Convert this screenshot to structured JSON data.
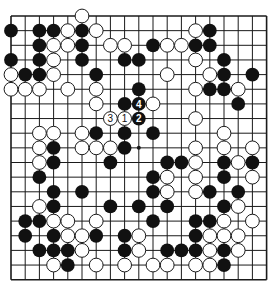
{
  "diagram": {
    "type": "go-board",
    "size": 19,
    "colors": {
      "black": "#111111",
      "white": "#ffffff",
      "line": "#1a1a1a",
      "background": "#ffffff"
    },
    "hoshi": [
      [
        3,
        3
      ],
      [
        3,
        9
      ],
      [
        3,
        15
      ],
      [
        9,
        3
      ],
      [
        9,
        9
      ],
      [
        9,
        15
      ],
      [
        15,
        3
      ],
      [
        15,
        9
      ],
      [
        15,
        15
      ]
    ],
    "stones": [
      {
        "r": 0,
        "c": 5,
        "color": "W"
      },
      {
        "r": 1,
        "c": 0,
        "color": "B"
      },
      {
        "r": 1,
        "c": 2,
        "color": "B"
      },
      {
        "r": 1,
        "c": 3,
        "color": "B"
      },
      {
        "r": 1,
        "c": 4,
        "color": "W"
      },
      {
        "r": 1,
        "c": 5,
        "color": "B"
      },
      {
        "r": 1,
        "c": 6,
        "color": "W"
      },
      {
        "r": 1,
        "c": 13,
        "color": "W"
      },
      {
        "r": 1,
        "c": 14,
        "color": "B"
      },
      {
        "r": 2,
        "c": 2,
        "color": "B"
      },
      {
        "r": 2,
        "c": 3,
        "color": "W"
      },
      {
        "r": 2,
        "c": 4,
        "color": "W"
      },
      {
        "r": 2,
        "c": 5,
        "color": "B"
      },
      {
        "r": 2,
        "c": 7,
        "color": "W"
      },
      {
        "r": 2,
        "c": 8,
        "color": "W"
      },
      {
        "r": 2,
        "c": 10,
        "color": "B"
      },
      {
        "r": 2,
        "c": 11,
        "color": "W"
      },
      {
        "r": 2,
        "c": 12,
        "color": "W"
      },
      {
        "r": 2,
        "c": 13,
        "color": "B"
      },
      {
        "r": 2,
        "c": 14,
        "color": "B"
      },
      {
        "r": 3,
        "c": 0,
        "color": "B"
      },
      {
        "r": 3,
        "c": 2,
        "color": "B"
      },
      {
        "r": 3,
        "c": 3,
        "color": "W"
      },
      {
        "r": 3,
        "c": 5,
        "color": "B"
      },
      {
        "r": 3,
        "c": 8,
        "color": "B"
      },
      {
        "r": 3,
        "c": 9,
        "color": "B"
      },
      {
        "r": 3,
        "c": 13,
        "color": "W"
      },
      {
        "r": 3,
        "c": 15,
        "color": "B"
      },
      {
        "r": 4,
        "c": 0,
        "color": "W"
      },
      {
        "r": 4,
        "c": 1,
        "color": "B"
      },
      {
        "r": 4,
        "c": 2,
        "color": "B"
      },
      {
        "r": 4,
        "c": 3,
        "color": "W"
      },
      {
        "r": 4,
        "c": 6,
        "color": "B"
      },
      {
        "r": 4,
        "c": 11,
        "color": "W"
      },
      {
        "r": 4,
        "c": 14,
        "color": "W"
      },
      {
        "r": 4,
        "c": 15,
        "color": "B"
      },
      {
        "r": 4,
        "c": 17,
        "color": "B"
      },
      {
        "r": 5,
        "c": 0,
        "color": "W"
      },
      {
        "r": 5,
        "c": 1,
        "color": "W"
      },
      {
        "r": 5,
        "c": 2,
        "color": "W"
      },
      {
        "r": 5,
        "c": 4,
        "color": "W"
      },
      {
        "r": 5,
        "c": 6,
        "color": "W"
      },
      {
        "r": 5,
        "c": 9,
        "color": "B"
      },
      {
        "r": 5,
        "c": 13,
        "color": "W"
      },
      {
        "r": 5,
        "c": 14,
        "color": "B"
      },
      {
        "r": 5,
        "c": 15,
        "color": "B"
      },
      {
        "r": 5,
        "c": 16,
        "color": "W"
      },
      {
        "r": 6,
        "c": 6,
        "color": "W"
      },
      {
        "r": 6,
        "c": 8,
        "color": "B"
      },
      {
        "r": 6,
        "c": 9,
        "color": "B",
        "label": "4"
      },
      {
        "r": 6,
        "c": 10,
        "color": "W"
      },
      {
        "r": 6,
        "c": 16,
        "color": "B"
      },
      {
        "r": 7,
        "c": 7,
        "color": "W",
        "label": "3"
      },
      {
        "r": 7,
        "c": 8,
        "color": "W",
        "label": "1"
      },
      {
        "r": 7,
        "c": 9,
        "color": "B",
        "label": "2"
      },
      {
        "r": 7,
        "c": 13,
        "color": "W"
      },
      {
        "r": 8,
        "c": 2,
        "color": "W"
      },
      {
        "r": 8,
        "c": 3,
        "color": "W"
      },
      {
        "r": 8,
        "c": 5,
        "color": "W"
      },
      {
        "r": 8,
        "c": 6,
        "color": "B"
      },
      {
        "r": 8,
        "c": 8,
        "color": "B"
      },
      {
        "r": 8,
        "c": 10,
        "color": "B"
      },
      {
        "r": 8,
        "c": 15,
        "color": "W"
      },
      {
        "r": 9,
        "c": 2,
        "color": "W"
      },
      {
        "r": 9,
        "c": 3,
        "color": "B"
      },
      {
        "r": 9,
        "c": 5,
        "color": "W"
      },
      {
        "r": 9,
        "c": 6,
        "color": "W"
      },
      {
        "r": 9,
        "c": 7,
        "color": "W"
      },
      {
        "r": 9,
        "c": 8,
        "color": "B"
      },
      {
        "r": 9,
        "c": 13,
        "color": "W"
      },
      {
        "r": 9,
        "c": 15,
        "color": "W"
      },
      {
        "r": 9,
        "c": 17,
        "color": "W"
      },
      {
        "r": 10,
        "c": 2,
        "color": "W"
      },
      {
        "r": 10,
        "c": 3,
        "color": "B"
      },
      {
        "r": 10,
        "c": 7,
        "color": "B"
      },
      {
        "r": 10,
        "c": 11,
        "color": "B"
      },
      {
        "r": 10,
        "c": 12,
        "color": "B"
      },
      {
        "r": 10,
        "c": 13,
        "color": "W"
      },
      {
        "r": 10,
        "c": 15,
        "color": "B"
      },
      {
        "r": 10,
        "c": 16,
        "color": "W"
      },
      {
        "r": 10,
        "c": 17,
        "color": "B"
      },
      {
        "r": 11,
        "c": 2,
        "color": "B"
      },
      {
        "r": 11,
        "c": 10,
        "color": "B"
      },
      {
        "r": 11,
        "c": 11,
        "color": "W"
      },
      {
        "r": 11,
        "c": 13,
        "color": "W"
      },
      {
        "r": 11,
        "c": 15,
        "color": "B"
      },
      {
        "r": 11,
        "c": 17,
        "color": "W"
      },
      {
        "r": 12,
        "c": 3,
        "color": "B"
      },
      {
        "r": 12,
        "c": 5,
        "color": "B"
      },
      {
        "r": 12,
        "c": 10,
        "color": "B"
      },
      {
        "r": 12,
        "c": 11,
        "color": "W"
      },
      {
        "r": 12,
        "c": 13,
        "color": "W"
      },
      {
        "r": 12,
        "c": 14,
        "color": "B"
      },
      {
        "r": 12,
        "c": 16,
        "color": "B"
      },
      {
        "r": 13,
        "c": 2,
        "color": "W"
      },
      {
        "r": 13,
        "c": 3,
        "color": "B"
      },
      {
        "r": 13,
        "c": 7,
        "color": "B"
      },
      {
        "r": 13,
        "c": 9,
        "color": "B"
      },
      {
        "r": 13,
        "c": 11,
        "color": "B"
      },
      {
        "r": 13,
        "c": 15,
        "color": "B"
      },
      {
        "r": 13,
        "c": 16,
        "color": "W"
      },
      {
        "r": 14,
        "c": 1,
        "color": "B"
      },
      {
        "r": 14,
        "c": 2,
        "color": "B"
      },
      {
        "r": 14,
        "c": 3,
        "color": "W"
      },
      {
        "r": 14,
        "c": 4,
        "color": "W"
      },
      {
        "r": 14,
        "c": 6,
        "color": "W"
      },
      {
        "r": 14,
        "c": 10,
        "color": "B"
      },
      {
        "r": 14,
        "c": 13,
        "color": "B"
      },
      {
        "r": 14,
        "c": 14,
        "color": "B"
      },
      {
        "r": 14,
        "c": 15,
        "color": "W"
      },
      {
        "r": 14,
        "c": 17,
        "color": "W"
      },
      {
        "r": 15,
        "c": 1,
        "color": "B"
      },
      {
        "r": 15,
        "c": 3,
        "color": "B"
      },
      {
        "r": 15,
        "c": 4,
        "color": "W"
      },
      {
        "r": 15,
        "c": 5,
        "color": "W"
      },
      {
        "r": 15,
        "c": 6,
        "color": "B"
      },
      {
        "r": 15,
        "c": 8,
        "color": "B"
      },
      {
        "r": 15,
        "c": 9,
        "color": "W"
      },
      {
        "r": 15,
        "c": 13,
        "color": "B"
      },
      {
        "r": 15,
        "c": 14,
        "color": "W"
      },
      {
        "r": 15,
        "c": 15,
        "color": "W"
      },
      {
        "r": 15,
        "c": 16,
        "color": "W"
      },
      {
        "r": 16,
        "c": 2,
        "color": "B"
      },
      {
        "r": 16,
        "c": 3,
        "color": "B"
      },
      {
        "r": 16,
        "c": 4,
        "color": "B"
      },
      {
        "r": 16,
        "c": 5,
        "color": "W"
      },
      {
        "r": 16,
        "c": 8,
        "color": "B"
      },
      {
        "r": 16,
        "c": 9,
        "color": "W"
      },
      {
        "r": 16,
        "c": 11,
        "color": "B"
      },
      {
        "r": 16,
        "c": 12,
        "color": "B"
      },
      {
        "r": 16,
        "c": 13,
        "color": "B"
      },
      {
        "r": 16,
        "c": 14,
        "color": "W"
      },
      {
        "r": 16,
        "c": 15,
        "color": "B"
      },
      {
        "r": 16,
        "c": 16,
        "color": "W"
      },
      {
        "r": 17,
        "c": 3,
        "color": "W"
      },
      {
        "r": 17,
        "c": 4,
        "color": "B"
      },
      {
        "r": 17,
        "c": 6,
        "color": "W"
      },
      {
        "r": 17,
        "c": 8,
        "color": "W"
      },
      {
        "r": 17,
        "c": 10,
        "color": "W"
      },
      {
        "r": 17,
        "c": 11,
        "color": "W"
      },
      {
        "r": 17,
        "c": 13,
        "color": "W"
      },
      {
        "r": 17,
        "c": 14,
        "color": "W"
      },
      {
        "r": 17,
        "c": 15,
        "color": "B"
      }
    ],
    "move_labels": [
      "1",
      "2",
      "3",
      "4"
    ]
  }
}
